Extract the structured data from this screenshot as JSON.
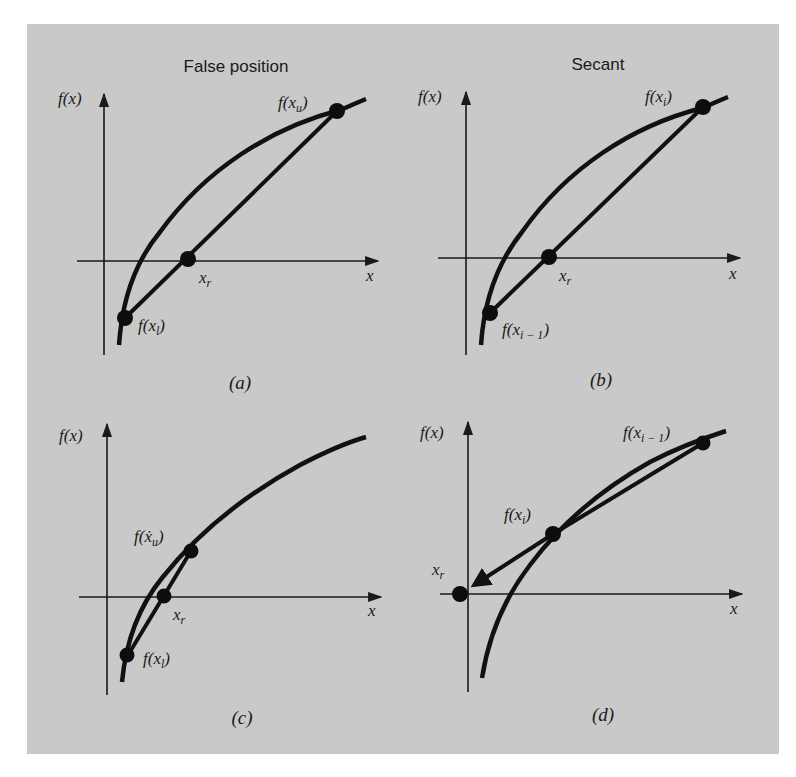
{
  "figure": {
    "background_color": "#c9c9c9",
    "ink_color": "#111111",
    "column_titles": [
      "False position",
      "Secant"
    ],
    "panels": [
      {
        "id": "a",
        "caption": "(a)",
        "method": "False position",
        "y_axis_label": "f(x)",
        "x_axis_label": "x",
        "points": [
          {
            "name": "f(x_u)",
            "label_main": "f(x",
            "label_sub": "u",
            "label_close": ")"
          },
          {
            "name": "f(x_l)",
            "label_main": "f(x",
            "label_sub": "l",
            "label_close": ")"
          },
          {
            "name": "x_r",
            "label_main": "x",
            "label_sub": "r",
            "label_close": ""
          }
        ]
      },
      {
        "id": "b",
        "caption": "(b)",
        "method": "Secant",
        "y_axis_label": "f(x)",
        "x_axis_label": "x",
        "points": [
          {
            "name": "f(x_i)",
            "label_main": "f(x",
            "label_sub": "i",
            "label_close": ")"
          },
          {
            "name": "f(x_{i-1})",
            "label_main": "f(x",
            "label_sub": "i − 1",
            "label_close": ")"
          },
          {
            "name": "x_r",
            "label_main": "x",
            "label_sub": "r",
            "label_close": ""
          }
        ]
      },
      {
        "id": "c",
        "caption": "(c)",
        "method": "False position",
        "y_axis_label": "f(x)",
        "x_axis_label": "x",
        "points": [
          {
            "name": "f(x_u)",
            "label_main": "f(ẋ",
            "label_sub": "u",
            "label_close": ")"
          },
          {
            "name": "f(x_l)",
            "label_main": "f(x",
            "label_sub": "l",
            "label_close": ")"
          },
          {
            "name": "x_r",
            "label_main": "x",
            "label_sub": "r",
            "label_close": ""
          }
        ]
      },
      {
        "id": "d",
        "caption": "(d)",
        "method": "Secant",
        "y_axis_label": "f(x)",
        "x_axis_label": "x",
        "points": [
          {
            "name": "f(x_{i-1})",
            "label_main": "f(x",
            "label_sub": "i − 1",
            "label_close": ")"
          },
          {
            "name": "f(x_i)",
            "label_main": "f(x",
            "label_sub": "i",
            "label_close": ")"
          },
          {
            "name": "x_r",
            "label_main": "x",
            "label_sub": "r",
            "label_close": ""
          }
        ]
      }
    ]
  }
}
